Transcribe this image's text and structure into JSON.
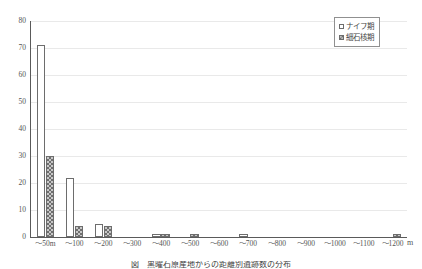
{
  "chart_data": {
    "type": "bar",
    "title": "",
    "xlabel": "",
    "ylabel": "",
    "unit_label": "m",
    "ylim": [
      0,
      80
    ],
    "ytick_step": 10,
    "yticks": [
      "80",
      "70",
      "60",
      "50",
      "40",
      "30",
      "20",
      "10",
      "0"
    ],
    "grid": true,
    "legend_position": "top-right",
    "categories": [
      "～50m",
      "～100",
      "～200",
      "～300",
      "～400",
      "～500",
      "～600",
      "～700",
      "～800",
      "～900",
      "～1000",
      "～1100",
      "～1200"
    ],
    "series": [
      {
        "name": "ナイフ期",
        "values": [
          71,
          22,
          5,
          0,
          1,
          0,
          0,
          1,
          0,
          0,
          0,
          0,
          0
        ]
      },
      {
        "name": "細石核期",
        "values": [
          30,
          4,
          4,
          0,
          1,
          1,
          0,
          0,
          0,
          0,
          0,
          0,
          1
        ]
      }
    ]
  },
  "legend": {
    "items": [
      {
        "label": "ナイフ期",
        "marker": "open-square-marker"
      },
      {
        "label": "細石核期",
        "marker": "hatched-square-marker"
      }
    ]
  },
  "caption": {
    "text": "図　黒曜石原産地からの距離別遺跡数の分布"
  }
}
